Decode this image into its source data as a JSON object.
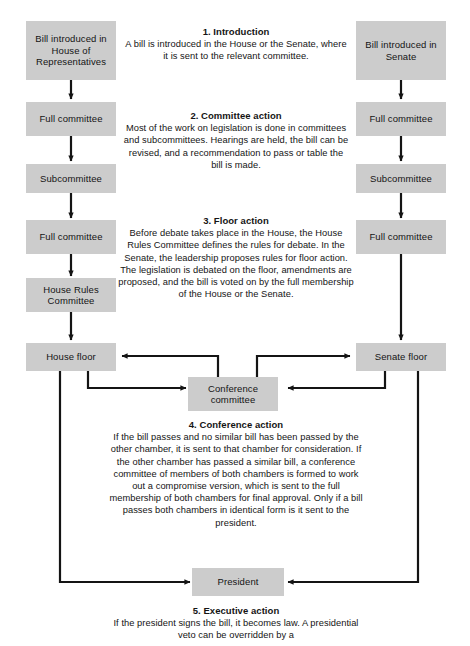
{
  "diagram": {
    "box_fill": "#cccccc",
    "line_color": "#141414",
    "boxes": {
      "house_intro": "Bill introduced in House of Representatives",
      "house_full_committee_1": "Full committee",
      "house_subcommittee": "Subcommittee",
      "house_full_committee_2": "Full committee",
      "house_rules_committee": "House Rules Committee",
      "house_floor": "House floor",
      "senate_intro": "Bill introduced in Senate",
      "senate_full_committee_1": "Full committee",
      "senate_subcommittee": "Subcommittee",
      "senate_full_committee_2": "Full committee",
      "senate_floor": "Senate floor",
      "conference_committee": "Conference committee",
      "president": "President"
    },
    "stages": [
      {
        "id": "introduction",
        "number": "1.",
        "title": "1.  Introduction",
        "body": "A bill is introduced in the House or the Senate, where it is sent to the relevant committee."
      },
      {
        "id": "committee-action",
        "number": "2.",
        "title": "2.  Committee action",
        "body": "Most of the work on legislation is done in committees and subcommittees. Hearings are held, the bill can be revised, and a recommendation to pass or table the bill is made."
      },
      {
        "id": "floor-action",
        "number": "3.",
        "title": "3.  Floor action",
        "body": "Before debate takes place in the House, the House Rules Committee defines the rules for debate. In the Senate, the leadership proposes rules for floor action. The legislation is debated on the floor, amendments are proposed, and the bill is voted on by the full membership of the House or the Senate."
      },
      {
        "id": "conference-action",
        "number": "4.",
        "title": "4.  Conference action",
        "body": "If the bill passes and no similar bill has been passed by the other chamber, it is sent to that chamber for consideration. If the other chamber has passed a similar bill, a conference committee of members of both chambers is formed to work out a compromise version, which is sent to the full membership of both chambers for final approval. Only if a bill passes both chambers in identical form is it sent to the president."
      },
      {
        "id": "executive-action",
        "number": "5.",
        "title": "5.  Executive action",
        "body": "If the president signs the bill, it becomes law. A presidential veto can be overridden by a"
      }
    ]
  }
}
